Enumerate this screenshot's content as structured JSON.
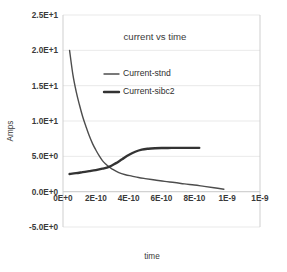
{
  "chart_data": {
    "type": "line",
    "title": "current vs time",
    "xlabel": "time",
    "ylabel": "Amps",
    "grid": true,
    "legend_position": "inside-upper-center",
    "xlim": [
      0,
      1.2e-09
    ],
    "ylim": [
      -5.0,
      25.0
    ],
    "ytick_labels": [
      "2.5E+1",
      "2.0E+1",
      "1.5E+1",
      "1.0E+1",
      "5.0E+0",
      "0.0E+0",
      "-5.0E+0"
    ],
    "ytick_values": [
      25,
      20,
      15,
      10,
      5,
      0,
      -5
    ],
    "xtick_labels": [
      "0E+0",
      "2E-10",
      "4E-10",
      "6E-10",
      "8E-10",
      "1E-9",
      "1E-9"
    ],
    "xtick_values": [
      0,
      2e-10,
      4e-10,
      6e-10,
      8e-10,
      1e-09,
      1.2e-09
    ],
    "series": [
      {
        "name": "Current-stnd",
        "color": "#4d4d4d",
        "width": 1.4,
        "x": [
          4e-11,
          6e-11,
          8e-11,
          1e-10,
          1.2e-10,
          1.4e-10,
          1.6e-10,
          1.8e-10,
          2e-10,
          2.2e-10,
          2.4e-10,
          2.6e-10,
          2.8e-10,
          3e-10,
          3.4e-10,
          3.8e-10,
          4.2e-10,
          4.6e-10,
          5e-10,
          5.6e-10,
          6.2e-10,
          6.8e-10,
          7.4e-10,
          8e-10,
          8.6e-10,
          9.2e-10,
          9.8e-10
        ],
        "y": [
          20.0,
          16.6,
          14.2,
          12.3,
          10.6,
          9.2,
          7.9,
          6.8,
          5.9,
          5.1,
          4.4,
          3.9,
          3.5,
          3.2,
          2.7,
          2.4,
          2.2,
          2.0,
          1.85,
          1.65,
          1.45,
          1.3,
          1.1,
          0.95,
          0.75,
          0.55,
          0.35
        ]
      },
      {
        "name": "Current-sibc2",
        "color": "#333333",
        "width": 2.4,
        "x": [
          4e-11,
          8e-11,
          1.2e-10,
          1.6e-10,
          2e-10,
          2.4e-10,
          2.8e-10,
          3.2e-10,
          3.6e-10,
          4e-10,
          4.4e-10,
          4.8e-10,
          5.2e-10,
          5.6e-10,
          6e-10,
          6.6e-10,
          7.2e-10,
          7.8e-10,
          8.3e-10
        ],
        "y": [
          2.5,
          2.62,
          2.76,
          2.9,
          3.05,
          3.25,
          3.5,
          4.0,
          4.6,
          5.2,
          5.65,
          5.95,
          6.08,
          6.14,
          6.17,
          6.19,
          6.2,
          6.2,
          6.2
        ]
      }
    ]
  },
  "legend": {
    "entries": [
      {
        "label": "Current-stnd"
      },
      {
        "label": "Current-sibc2"
      }
    ]
  }
}
